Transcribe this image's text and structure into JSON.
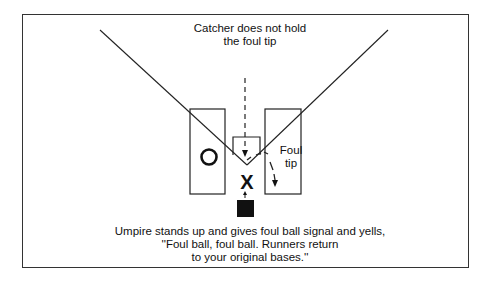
{
  "diagram": {
    "top_caption": {
      "line1": "Catcher does not hold",
      "line2": "the foul tip"
    },
    "bottom_caption": {
      "line1": "Umpire stands up and gives foul ball signal and yells,",
      "line2": "''Foul ball, foul ball. Runners return",
      "line3": "to your original bases.''"
    },
    "foul_tip_label": {
      "line1": "Foul",
      "line2": "tip"
    },
    "symbols": {
      "catcher": "O",
      "batter": "X"
    },
    "colors": {
      "ink": "#111111",
      "background": "#ffffff"
    }
  }
}
